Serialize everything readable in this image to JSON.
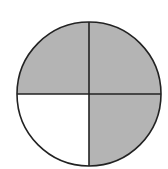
{
  "diagram": {
    "type": "fraction-circle",
    "total_parts": 4,
    "shaded_parts": 3,
    "shaded_fraction": "3/4",
    "colors": {
      "shaded": "#b4b4b4",
      "unshaded": "#ffffff",
      "stroke": "#222222"
    },
    "quadrants": [
      {
        "position": "top-left",
        "shaded": true
      },
      {
        "position": "top-right",
        "shaded": true
      },
      {
        "position": "bottom-left",
        "shaded": false
      },
      {
        "position": "bottom-right",
        "shaded": true
      }
    ]
  }
}
